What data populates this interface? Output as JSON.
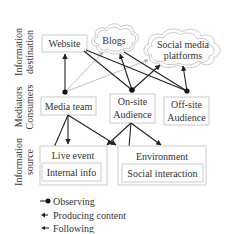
{
  "layers": {
    "destination": [
      "Information",
      "destination"
    ],
    "mediators": [
      "Mediators",
      "Consumers"
    ],
    "source": [
      "Information",
      "source"
    ]
  },
  "nodes": {
    "website": "Website",
    "blogs": "Blogs",
    "social_media": [
      "Social media",
      "platforms"
    ],
    "media_team": "Media team",
    "onsite": [
      "On-site",
      "Audience"
    ],
    "offsite": [
      "Off-site",
      "Audience"
    ],
    "live_event": "Live event",
    "internal_info": "Internal info",
    "environment": "Environment",
    "social_interaction": "Social interaction"
  },
  "legend": {
    "observing": "Observing",
    "producing": "Producing content",
    "following": "Following"
  },
  "colors": {
    "edge": "#222222",
    "edge_light": "#b0b0b0",
    "box_border": "#bfbfbf",
    "text": "#333333"
  }
}
